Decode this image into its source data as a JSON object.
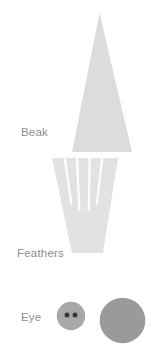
{
  "page": {
    "background_color": "#ffffff",
    "width": 167,
    "height": 356
  },
  "labels": {
    "beak": "Beak",
    "feathers": "Feathers",
    "eye": "Eye",
    "color": "#8e8e8e"
  },
  "parts": [
    {
      "id": "beak",
      "label": "Beak",
      "shape": "triangle",
      "fill": "#dcdcdc",
      "description": "Tall narrow isosceles triangle, apex at top"
    },
    {
      "id": "feathers",
      "label": "Feathers",
      "shape": "slitted-trapezoid",
      "fill": "#e2e2e2",
      "slit_count": 4,
      "strip_count": 5,
      "description": "Inverted trapezoid, wide at top, with four vertical slits cut down from the top edge"
    },
    {
      "id": "eye",
      "label": "Eye",
      "shape": "circles",
      "items": [
        {
          "id": "eye-button",
          "shape": "button",
          "fill": "#a8a8a8",
          "hole_fill": "#3a3a3a",
          "hole_count": 2
        },
        {
          "id": "eye-circle",
          "shape": "circle",
          "fill": "#9a9a9a"
        }
      ]
    }
  ]
}
